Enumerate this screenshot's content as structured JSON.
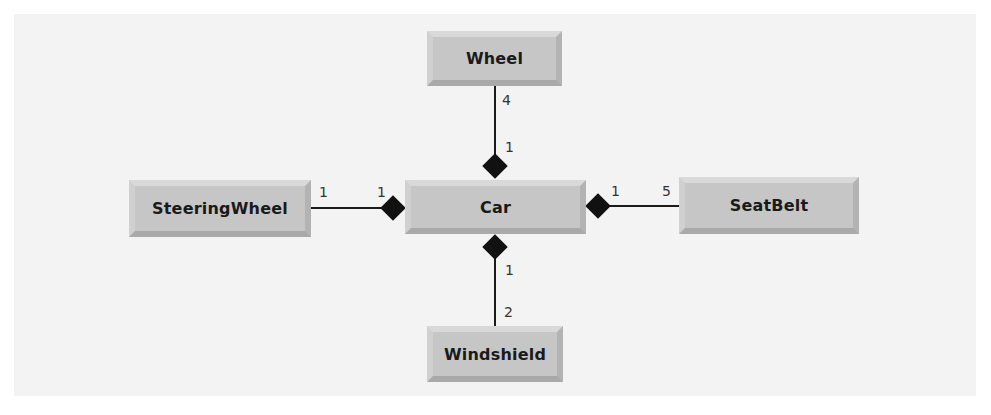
{
  "diagram": {
    "type": "uml-class-composition",
    "colors": {
      "box_face": "#c6c6c6",
      "background": "#f3f3f3",
      "line": "#1a1a1a"
    },
    "classes": {
      "car": "Car",
      "wheel": "Wheel",
      "steering_wheel": "SteeringWheel",
      "seat_belt": "SeatBelt",
      "windshield": "Windshield"
    },
    "associations": {
      "wheel": {
        "whole_mult": "1",
        "part_mult": "4"
      },
      "steering_wheel": {
        "whole_mult": "1",
        "part_mult": "1"
      },
      "seat_belt": {
        "whole_mult": "1",
        "part_mult": "5"
      },
      "windshield": {
        "whole_mult": "1",
        "part_mult": "2"
      }
    }
  }
}
